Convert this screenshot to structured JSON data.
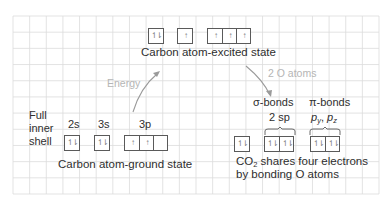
{
  "colors": {
    "grid_line": "#dcdcdc",
    "box_border": "#5a5a5a",
    "text": "#2e2e2e",
    "annotation": "#b5b5b5",
    "arrow": "#9a9a9a"
  },
  "excited_state": {
    "caption": "Carbon atom-excited state",
    "orbitals": [
      {
        "name": "2s",
        "cells": [
          "paired"
        ]
      },
      {
        "name": "3s",
        "cells": [
          "up"
        ]
      },
      {
        "name": "3p",
        "cells": [
          "up",
          "up",
          "up"
        ]
      }
    ]
  },
  "ground_state": {
    "side_label": [
      "Full",
      "inner",
      "shell"
    ],
    "orbital_labels": [
      "2s",
      "3s",
      "3p"
    ],
    "caption": "Carbon atom-ground state",
    "orbitals": [
      {
        "name": "2s",
        "cells": [
          "paired"
        ]
      },
      {
        "name": "3s",
        "cells": [
          "paired"
        ]
      },
      {
        "name": "3p",
        "cells": [
          "up",
          "up",
          "empty"
        ]
      }
    ]
  },
  "arrows": {
    "energy_label": "Energy",
    "oxygen_label": "2 O atoms"
  },
  "co2_state": {
    "sigma_label": "σ-bonds",
    "pi_label": "π-bonds",
    "sigma_sub": "2 sp",
    "pi_sub_p": "p",
    "pi_sub_y": "y",
    "pi_sub_sep": ", ",
    "pi_sub_z": "z",
    "caption_co": "CO",
    "caption_sub": "2",
    "caption_rest": " shares four electrons",
    "caption_line2": "by bonding O atoms",
    "orbitals": [
      {
        "name": "2s",
        "cells": [
          "paired"
        ]
      },
      {
        "name": "sp",
        "cells": [
          "paired",
          "paired"
        ]
      },
      {
        "name": "p",
        "cells": [
          "paired",
          "paired"
        ]
      }
    ]
  },
  "electron_glyphs": {
    "paired": "↿⇂",
    "up": "↑",
    "empty": ""
  }
}
